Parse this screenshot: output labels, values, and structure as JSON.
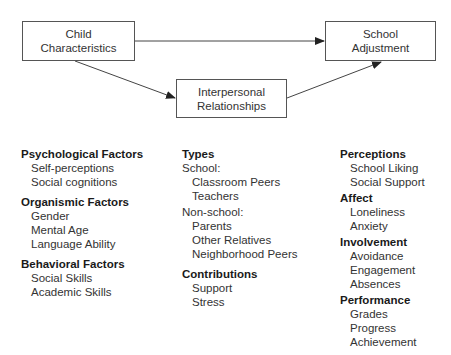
{
  "diagram": {
    "nodes": {
      "child": {
        "line1": "Child",
        "line2": "Characteristics"
      },
      "school": {
        "line1": "School",
        "line2": "Adjustment"
      },
      "interpersonal": {
        "line1": "Interpersonal",
        "line2": "Relationships"
      }
    },
    "edges": [
      {
        "from": "child",
        "to": "school"
      },
      {
        "from": "child",
        "to": "interpersonal"
      },
      {
        "from": "interpersonal",
        "to": "school"
      }
    ]
  },
  "left_column": {
    "groups": [
      {
        "title": "Psychological Factors",
        "items": [
          "Self-perceptions",
          "Social cognitions"
        ]
      },
      {
        "title": "Organismic Factors",
        "items": [
          "Gender",
          "Mental Age",
          "Language Ability"
        ]
      },
      {
        "title": "Behavioral Factors",
        "items": [
          "Social Skills",
          "Academic Skills"
        ]
      }
    ]
  },
  "middle_column": {
    "types": {
      "title": "Types",
      "school_label": "School:",
      "school_items": [
        "Classroom Peers",
        "Teachers"
      ],
      "nonschool_label": "Non-school:",
      "nonschool_items": [
        "Parents",
        "Other Relatives",
        "Neighborhood Peers"
      ]
    },
    "contributions": {
      "title": "Contributions",
      "items": [
        "Support",
        "Stress"
      ]
    }
  },
  "right_column": {
    "groups": [
      {
        "title": "Perceptions",
        "items": [
          "School Liking",
          "Social Support"
        ]
      },
      {
        "title": "Affect",
        "items": [
          "Loneliness",
          "Anxiety"
        ]
      },
      {
        "title": "Involvement",
        "items": [
          "Avoidance",
          "Engagement",
          "Absences"
        ]
      },
      {
        "title": "Performance",
        "items": [
          "Grades",
          "Progress",
          "Achievement"
        ]
      }
    ]
  }
}
